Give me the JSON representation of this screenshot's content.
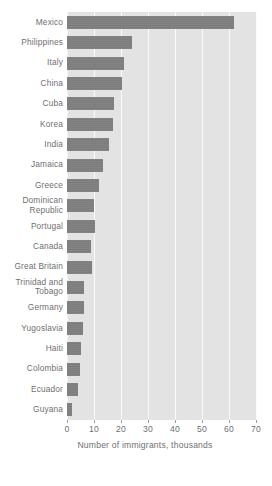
{
  "chart_data": {
    "type": "bar",
    "orientation": "horizontal",
    "title": "",
    "subtitle": "",
    "xlabel": "Number of immigrants, thousands",
    "ylabel": "",
    "xlim": [
      0,
      70
    ],
    "xticks": [
      0,
      10,
      20,
      30,
      40,
      50,
      60,
      70
    ],
    "xtick_labels": [
      "0",
      "10",
      "20",
      "30",
      "40",
      "50",
      "60",
      "70"
    ],
    "grid": "vertical-only",
    "legend": "none",
    "categories": [
      "Mexico",
      "Philippines",
      "Italy",
      "China",
      "Cuba",
      "Korea",
      "India",
      "Jamaica",
      "Greece",
      "Dominican\nRepublic",
      "Portugal",
      "Canada",
      "Great Britain",
      "Trinidad and\nTobago",
      "Germany",
      "Yugoslavia",
      "Haiti",
      "Colombia",
      "Ecuador",
      "Guyana"
    ],
    "values": [
      62,
      24,
      21,
      20.4,
      17.5,
      17,
      15.7,
      13.2,
      11.8,
      10.1,
      10.4,
      9,
      9.4,
      6.2,
      6.2,
      6.1,
      5.1,
      4.9,
      4,
      2
    ],
    "series": [
      {
        "name": "Number of immigrants, thousands",
        "values": [
          62,
          24,
          21,
          20.4,
          17.5,
          17,
          15.7,
          13.2,
          11.8,
          10.1,
          10.4,
          9,
          9.4,
          6.2,
          6.2,
          6.1,
          5.1,
          4.9,
          4,
          2
        ]
      }
    ]
  },
  "style": {
    "bar_color": "#7d7d7d",
    "plot_background": "#e3e3e3",
    "gridline_color": "#fbfbfb",
    "text_color": "#6f6f6f",
    "page_background": "#ffffff"
  }
}
